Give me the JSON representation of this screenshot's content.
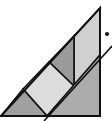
{
  "diagram": {
    "colors": {
      "background": "#ffffff",
      "stroke": "#111111",
      "top_right_strip": "#d0d0d0",
      "upper_dark_triangle": "#9a9a9a",
      "center_square": "#dcdcdc",
      "bottom_left_triangle": "#a0a0a0",
      "bottom_right_triangle": "#acacac",
      "dot": "#111111"
    },
    "outer_triangle": [
      [
        1,
        116
      ],
      [
        100,
        8
      ],
      [
        100,
        116
      ]
    ],
    "regions": {
      "top_right_strip": [
        [
          74,
          36
        ],
        [
          100,
          8
        ],
        [
          100,
          55
        ],
        [
          74,
          86
        ]
      ],
      "upper_dark_triangle": [
        [
          49,
          62
        ],
        [
          74,
          36
        ],
        [
          74,
          86
        ]
      ],
      "center_square": [
        [
          23,
          89
        ],
        [
          49,
          62
        ],
        [
          74,
          86
        ],
        [
          47,
          116
        ]
      ],
      "bottom_left_triangle": [
        [
          1,
          116
        ],
        [
          23,
          89
        ],
        [
          47,
          116
        ]
      ],
      "bottom_right_triangle": [
        [
          47,
          116
        ],
        [
          100,
          55
        ],
        [
          100,
          116
        ]
      ]
    },
    "transversal_line": [
      [
        44,
        121
      ],
      [
        112,
        46
      ]
    ],
    "dot": {
      "cx": 107,
      "cy": 34,
      "r": 2
    }
  }
}
